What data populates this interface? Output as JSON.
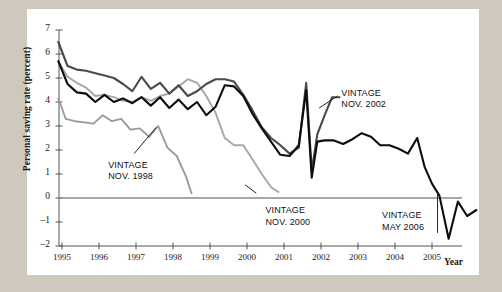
{
  "chart_data": {
    "type": "line",
    "title": "",
    "xlabel": "Year",
    "ylabel": "Personal saving rate (percent)",
    "xlim": [
      1994.8,
      2006.6
    ],
    "ylim": [
      -2,
      7
    ],
    "yticks": [
      7,
      6,
      5,
      4,
      3,
      2,
      1,
      0,
      -1,
      -2
    ],
    "ytick_labels": [
      "7",
      "6",
      "5",
      "4",
      "3",
      "2",
      "1",
      "0",
      "–1",
      "–2"
    ],
    "xticks": [
      1995,
      1996,
      1997,
      1998,
      1999,
      2000,
      2001,
      2002,
      2003,
      2004,
      2005
    ],
    "xtick_labels": [
      "1995",
      "1996",
      "1997",
      "1998",
      "1999",
      "2000",
      "2001",
      "2002",
      "2003",
      "2004",
      "2005"
    ],
    "grid": false,
    "legend_position": "inline-annotations",
    "zero_line": 0,
    "series": [
      {
        "name": "VINTAGE NOV. 1998",
        "color": "#9a9a9a",
        "width": 1.9,
        "x": [
          1994.9,
          1995.1,
          1995.35,
          1995.6,
          1995.85,
          1996.1,
          1996.35,
          1996.6,
          1996.85,
          1997.1,
          1997.35,
          1997.6,
          1997.85,
          1998.1,
          1998.35,
          1998.5
        ],
        "values": [
          4.15,
          3.3,
          3.2,
          3.15,
          3.1,
          3.45,
          3.2,
          3.3,
          2.85,
          2.9,
          2.55,
          3.0,
          2.1,
          1.75,
          0.9,
          0.2
        ]
      },
      {
        "name": "VINTAGE NOV. 2000",
        "color": "#a6a6a6",
        "width": 1.9,
        "x": [
          1994.9,
          1995.15,
          1995.4,
          1995.65,
          1995.9,
          1996.15,
          1996.4,
          1996.65,
          1996.9,
          1997.15,
          1997.4,
          1997.65,
          1997.9,
          1998.15,
          1998.4,
          1998.65,
          1998.9,
          1999.15,
          1999.4,
          1999.65,
          1999.9,
          2000.15,
          2000.4,
          2000.65,
          2000.85
        ],
        "values": [
          5.7,
          5.05,
          4.8,
          4.6,
          4.25,
          4.3,
          4.2,
          4.05,
          4.0,
          4.2,
          4.05,
          4.25,
          4.35,
          4.65,
          4.95,
          4.8,
          4.25,
          3.55,
          2.5,
          2.2,
          2.2,
          1.6,
          1.0,
          0.45,
          0.25
        ]
      },
      {
        "name": "VINTAGE NOV. 2002",
        "color": "#4a4a4a",
        "width": 2.1,
        "x": [
          1994.9,
          1995.15,
          1995.4,
          1995.65,
          1995.9,
          1996.15,
          1996.4,
          1996.65,
          1996.9,
          1997.15,
          1997.4,
          1997.65,
          1997.9,
          1998.15,
          1998.4,
          1998.65,
          1998.9,
          1999.15,
          1999.4,
          1999.65,
          1999.9,
          2000.15,
          2000.4,
          2000.65,
          2000.9,
          2001.15,
          2001.4,
          2001.6,
          2001.75,
          2001.9,
          2002.1,
          2002.3,
          2002.5
        ],
        "values": [
          6.5,
          5.5,
          5.35,
          5.3,
          5.2,
          5.1,
          5.0,
          4.75,
          4.45,
          5.05,
          4.55,
          4.8,
          4.35,
          4.7,
          4.25,
          4.45,
          4.75,
          4.95,
          4.95,
          4.85,
          4.3,
          3.65,
          2.95,
          2.5,
          2.2,
          1.85,
          2.1,
          4.8,
          1.15,
          2.65,
          3.45,
          4.2,
          4.2
        ]
      },
      {
        "name": "VINTAGE MAY 2006",
        "color": "#0d0d0d",
        "width": 2.1,
        "x": [
          1994.9,
          1995.15,
          1995.4,
          1995.65,
          1995.9,
          1996.15,
          1996.4,
          1996.65,
          1996.9,
          1997.15,
          1997.4,
          1997.65,
          1997.9,
          1998.15,
          1998.4,
          1998.65,
          1998.9,
          1999.15,
          1999.4,
          1999.65,
          1999.9,
          2000.15,
          2000.4,
          2000.65,
          2000.9,
          2001.15,
          2001.4,
          2001.6,
          2001.75,
          2001.9,
          2002.1,
          2002.35,
          2002.6,
          2002.85,
          2003.1,
          2003.35,
          2003.6,
          2003.85,
          2004.1,
          2004.35,
          2004.6,
          2004.8,
          2005.0,
          2005.2,
          2005.45,
          2005.7,
          2005.95,
          2006.2
        ],
        "values": [
          5.7,
          4.75,
          4.4,
          4.35,
          4.0,
          4.3,
          4.0,
          4.15,
          3.95,
          4.2,
          3.85,
          4.2,
          3.75,
          4.1,
          3.7,
          4.0,
          3.45,
          3.8,
          4.7,
          4.65,
          4.25,
          3.5,
          2.9,
          2.35,
          1.8,
          1.75,
          2.2,
          4.5,
          0.85,
          2.35,
          2.4,
          2.4,
          2.25,
          2.45,
          2.7,
          2.55,
          2.2,
          2.2,
          2.05,
          1.85,
          2.5,
          1.3,
          0.6,
          0.1,
          -1.7,
          -0.15,
          -0.75,
          -0.5
        ]
      }
    ],
    "annotations": [
      {
        "name": "vintage-nov-1998",
        "text": "VINTAGE\nNOV. 1998",
        "x": 1996.25,
        "y": 1.35
      },
      {
        "name": "vintage-nov-2000",
        "text": "VINTAGE\nNOV. 2000",
        "x": 2000.5,
        "y": -0.55
      },
      {
        "name": "vintage-nov-2002",
        "text": "VINTAGE\nNOV. 2002",
        "x": 2002.55,
        "y": 4.35
      },
      {
        "name": "vintage-may-2006",
        "text": "VINTAGE\nMAY 2006",
        "x": 2003.65,
        "y": -0.75
      }
    ],
    "leader_lines": [
      {
        "name": "leader-nov-1998",
        "x1": 1996.95,
        "y1": 1.85,
        "x2": 1997.55,
        "y2": 2.95
      },
      {
        "name": "leader-nov-2000",
        "x1": 2000.25,
        "y1": 0.2,
        "x2": 1999.95,
        "y2": 0.55
      },
      {
        "name": "leader-nov-2002",
        "x1": 2002.45,
        "y1": 4.25,
        "x2": 2001.95,
        "y2": 3.75
      },
      {
        "name": "leader-may-2006",
        "x1": 2005.15,
        "y1": 0.25,
        "x2": 2005.15,
        "y2": -1.45
      }
    ]
  },
  "axis": {
    "y_title": "Personal saving rate (percent)",
    "x_title": "Year"
  }
}
